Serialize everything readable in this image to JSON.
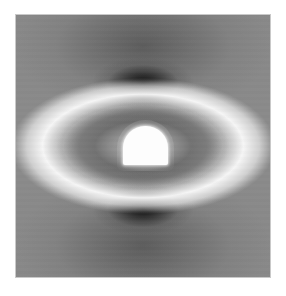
{
  "figure": {
    "title": "",
    "caption": "Grayscale scalar field distribution around an arch-shaped tunnel cavity",
    "background_color": "#ffffff",
    "frame_color": "#c9c9c9"
  },
  "chart_data": {
    "type": "heatmap",
    "title": "",
    "subtitle": "",
    "xlabel": "",
    "ylabel": "",
    "colormap": "grayscale",
    "colorbar": false,
    "grid": false,
    "legend": null,
    "axis_ticks": [],
    "xlim": [
      -1,
      1
    ],
    "ylim": [
      -1,
      1
    ],
    "value_range": [
      0.0,
      1.0
    ],
    "symmetry": "bilateral about vertical and horizontal axes through cavity center",
    "masked_region": {
      "name": "tunnel-cavity",
      "shape": "arch",
      "center_x": 0.5,
      "center_y": 0.5,
      "width_fraction": 0.176,
      "height_fraction": 0.148,
      "fill": "#fdfdfd",
      "description": "flat-floored arch (semicircular crown) excavation, rendered as solid white void"
    },
    "features": [
      {
        "name": "upper-dark-lobe",
        "kind": "minimum",
        "center_x": 0.5,
        "center_y": 0.26,
        "value": 0.06,
        "color": "#1a1a1a",
        "extent_x": 0.4,
        "extent_y": 0.2
      },
      {
        "name": "lower-dark-lobe",
        "kind": "minimum",
        "center_x": 0.5,
        "center_y": 0.74,
        "value": 0.06,
        "color": "#1a1a1a",
        "extent_x": 0.4,
        "extent_y": 0.2
      },
      {
        "name": "lateral-bright-halo",
        "kind": "maximum",
        "center_x": 0.5,
        "center_y": 0.5,
        "value": 0.97,
        "color": "#f7f7f7",
        "extent_x": 0.78,
        "extent_y": 0.4
      },
      {
        "name": "near-wall-dark-ring",
        "kind": "intermediate",
        "center_x": 0.5,
        "center_y": 0.5,
        "value": 0.33,
        "color": "#4a4a4a",
        "extent_x": 0.34,
        "extent_y": 0.18
      },
      {
        "name": "far-field-background",
        "kind": "baseline",
        "value": 0.54,
        "color": "#8a8a8a"
      }
    ],
    "contour_bands": [
      {
        "label": "band-1",
        "value": 0.06,
        "color": "#1a1a1a"
      },
      {
        "label": "band-2",
        "value": 0.18,
        "color": "#2f2f2f"
      },
      {
        "label": "band-3",
        "value": 0.3,
        "color": "#4a4a4a"
      },
      {
        "label": "band-4",
        "value": 0.42,
        "color": "#6b6b6b"
      },
      {
        "label": "band-5",
        "value": 0.54,
        "color": "#8a8a8a"
      },
      {
        "label": "band-6",
        "value": 0.66,
        "color": "#a8a8a8"
      },
      {
        "label": "band-7",
        "value": 0.78,
        "color": "#c6c6c6"
      },
      {
        "label": "band-8",
        "value": 0.9,
        "color": "#e4e4e4"
      },
      {
        "label": "band-9",
        "value": 0.97,
        "color": "#f7f7f7"
      }
    ]
  }
}
